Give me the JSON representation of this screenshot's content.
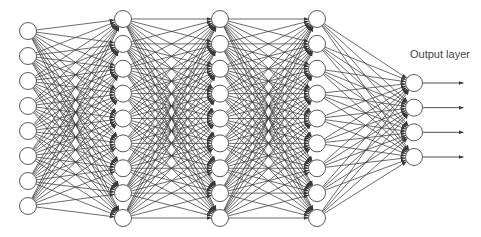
{
  "diagram": {
    "type": "feedforward-neural-network",
    "labels": {
      "output_layer": "Output layer"
    },
    "colors": {
      "background": "#ffffff",
      "edge": "#3a3a3a",
      "node_stroke": "#5a5a5a",
      "node_fill": "#ffffff",
      "label": "#444444"
    },
    "node_radius": 8.5,
    "layers": [
      {
        "name": "input-layer",
        "x": 28,
        "count": 8,
        "y_start": 31,
        "y_end": 206
      },
      {
        "name": "hidden-layer-1",
        "x": 123,
        "count": 9,
        "y_start": 19,
        "y_end": 218
      },
      {
        "name": "hidden-layer-2",
        "x": 220,
        "count": 9,
        "y_start": 19,
        "y_end": 218
      },
      {
        "name": "hidden-layer-3",
        "x": 317,
        "count": 9,
        "y_start": 19,
        "y_end": 218
      },
      {
        "name": "output-layer",
        "x": 414,
        "count": 4,
        "y_start": 83,
        "y_end": 157
      }
    ],
    "output_arrows": {
      "length": 41
    },
    "output_label_position": {
      "x": 410,
      "y": 48
    }
  }
}
